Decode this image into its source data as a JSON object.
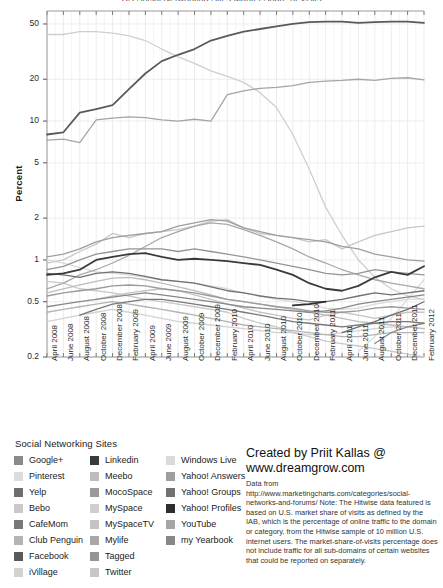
{
  "title_clipped": "US Social Networking Sites Market Share of Visits",
  "axes": {
    "ylabel": "Percent",
    "yticks": [
      "50",
      "20",
      "10",
      "5",
      "2",
      "1",
      "0.5",
      "0.2"
    ],
    "ytick_values": [
      50,
      20,
      10,
      5,
      2,
      1,
      0.5,
      0.2
    ],
    "yscale": "log",
    "ylim": [
      0.2,
      62
    ],
    "xticks": [
      "April 2008",
      "June 2008",
      "August 2008",
      "October 2008",
      "December 2008",
      "February 2009",
      "April 2009",
      "June 2009",
      "August 2009",
      "October 2009",
      "December 2009",
      "February 2010",
      "April 2010",
      "June 2010",
      "August 2010",
      "October 2010",
      "December 2010",
      "February 2011",
      "April 2011",
      "June 2011",
      "August 2011",
      "October 2011",
      "December 2011",
      "February 2012"
    ]
  },
  "legend": {
    "title": "Social Networking Sites",
    "columns": [
      [
        {
          "label": "Google+",
          "color": "#8a8a8a"
        },
        {
          "label": "Pinterest",
          "color": "#dcdcdc"
        },
        {
          "label": "Yelp",
          "color": "#6e6e6e"
        },
        {
          "label": "Bebo",
          "color": "#c9c9c9"
        },
        {
          "label": "CafeMom",
          "color": "#787878"
        },
        {
          "label": "Club Penguin",
          "color": "#b4b4b4"
        },
        {
          "label": "Facebook",
          "color": "#5a5a5a"
        },
        {
          "label": "iVillage",
          "color": "#d2d2d2"
        }
      ],
      [
        {
          "label": "Linkedin",
          "color": "#3a3a3a"
        },
        {
          "label": "Meebo",
          "color": "#bdbdbd"
        },
        {
          "label": "MocoSpace",
          "color": "#9a9a9a"
        },
        {
          "label": "MySpace",
          "color": "#cfcfcf"
        },
        {
          "label": "MySpaceTV",
          "color": "#c4c4c4"
        },
        {
          "label": "Mylife",
          "color": "#a8a8a8"
        },
        {
          "label": "Tagged",
          "color": "#949494"
        },
        {
          "label": "Twitter",
          "color": "#c7c7c7"
        }
      ],
      [
        {
          "label": "Windows Live",
          "color": "#dadada"
        },
        {
          "label": "Yahoo! Answers",
          "color": "#9e9e9e"
        },
        {
          "label": "Yahoo! Groups",
          "color": "#707070"
        },
        {
          "label": "Yahoo! Profiles",
          "color": "#2e2e2e"
        },
        {
          "label": "YouTube",
          "color": "#a5a5a5"
        },
        {
          "label": "my Yearbook",
          "color": "#888888"
        }
      ]
    ]
  },
  "credit": {
    "line1": "Created by Priit Kallas @",
    "line2": "www.dreamgrow.com",
    "note": "Data from http://www.marketingcharts.com/categories/social-networks-and-forums/ Note: The Hitwise data featured is based on U.S. market share of visits as defined by the IAB, which is the percentage of online traffic to the domain or category, from the Hitwise sample of 10 million U.S. internet users. The market-share-of-visits percentage does not include traffic for all sub-domains of certain websites that could be reported on separately."
  },
  "chart_data": {
    "type": "line",
    "title": "US Social Networking Sites Market Share of Visits",
    "xlabel": "",
    "ylabel": "Percent",
    "yscale": "log",
    "ylim": [
      0.2,
      62
    ],
    "grid": true,
    "legend_position": "below",
    "x": [
      "April 2008",
      "June 2008",
      "August 2008",
      "October 2008",
      "December 2008",
      "February 2009",
      "April 2009",
      "June 2009",
      "August 2009",
      "October 2009",
      "December 2009",
      "February 2010",
      "April 2010",
      "June 2010",
      "August 2010",
      "October 2010",
      "December 2010",
      "February 2011",
      "April 2011",
      "June 2011",
      "August 2011",
      "October 2011",
      "December 2011",
      "February 2012"
    ],
    "series": [
      {
        "name": "Facebook",
        "color": "#5a5a5a",
        "values": [
          8.0,
          8.3,
          11.5,
          12.2,
          13.0,
          17.0,
          22.0,
          27.0,
          30.0,
          33.0,
          38.0,
          41.0,
          44.0,
          46.0,
          48.0,
          50.0,
          51.5,
          52.0,
          52.0,
          51.0,
          51.5,
          52.0,
          52.0,
          51.0
        ]
      },
      {
        "name": "MySpace",
        "color": "#cfcfcf",
        "values": [
          42.0,
          42.0,
          44.0,
          44.0,
          43.0,
          41.0,
          38.0,
          33.0,
          29.0,
          26.0,
          23.0,
          21.0,
          19.0,
          16.0,
          12.5,
          8.0,
          4.5,
          2.4,
          1.5,
          1.0,
          0.75,
          0.62,
          0.55,
          0.52
        ]
      },
      {
        "name": "YouTube",
        "color": "#a5a5a5",
        "values": [
          7.3,
          7.4,
          7.0,
          10.2,
          10.5,
          10.7,
          10.6,
          10.2,
          10.0,
          10.3,
          10.0,
          15.5,
          16.5,
          17.2,
          17.5,
          18.0,
          19.0,
          19.4,
          19.6,
          20.0,
          19.6,
          20.3,
          20.5,
          19.8
        ]
      },
      {
        "name": "Twitter",
        "color": "#c7c7c7",
        "values": [
          0.95,
          1.0,
          1.15,
          1.3,
          1.55,
          1.45,
          1.55,
          1.6,
          1.65,
          1.75,
          1.9,
          1.95,
          1.7,
          1.55,
          1.5,
          1.45,
          1.35,
          1.4,
          1.2,
          1.35,
          1.5,
          1.6,
          1.7,
          1.75
        ]
      },
      {
        "name": "Yahoo! Answers",
        "color": "#9e9e9e",
        "values": [
          1.05,
          1.1,
          1.2,
          1.35,
          1.45,
          1.5,
          1.55,
          1.6,
          1.75,
          1.85,
          1.95,
          1.9,
          1.7,
          1.6,
          1.5,
          1.45,
          1.4,
          1.35,
          1.25,
          1.2,
          1.1,
          1.05,
          1.0,
          0.98
        ]
      },
      {
        "name": "Tagged",
        "color": "#949494",
        "values": [
          0.85,
          0.9,
          1.0,
          1.1,
          1.15,
          1.2,
          1.2,
          1.2,
          1.15,
          1.2,
          1.15,
          1.1,
          1.05,
          1.0,
          0.95,
          0.9,
          0.85,
          0.8,
          0.78,
          0.8,
          0.85,
          0.82,
          0.8,
          0.78
        ]
      },
      {
        "name": "Linkedin",
        "color": "#3a3a3a",
        "values": [
          0.78,
          0.8,
          0.85,
          1.0,
          1.05,
          1.1,
          1.12,
          1.05,
          1.0,
          1.02,
          1.0,
          0.98,
          0.95,
          0.92,
          0.85,
          0.78,
          0.68,
          0.62,
          0.6,
          0.65,
          0.75,
          0.82,
          0.78,
          0.9
        ]
      },
      {
        "name": "Yahoo! Groups",
        "color": "#707070",
        "values": [
          0.8,
          0.78,
          0.75,
          0.8,
          0.82,
          0.8,
          0.76,
          0.72,
          0.7,
          0.68,
          0.64,
          0.6,
          0.58,
          0.55,
          0.53,
          0.52,
          0.5,
          0.5,
          0.52,
          0.55,
          0.58,
          0.56,
          0.58,
          0.6
        ]
      },
      {
        "name": "Windows Live",
        "color": "#dadada",
        "values": [
          1.0,
          0.95,
          0.88,
          0.82,
          0.8,
          0.78,
          0.75,
          0.72,
          0.7,
          0.68,
          0.65,
          0.62,
          0.58,
          0.55,
          0.52,
          0.5,
          0.48,
          0.45,
          0.44,
          0.45,
          0.48,
          0.5,
          0.52,
          0.52
        ]
      },
      {
        "name": "Mylife",
        "color": "#a8a8a8",
        "values": [
          0.62,
          0.68,
          0.78,
          0.85,
          0.95,
          1.08,
          1.25,
          1.45,
          1.6,
          1.75,
          1.85,
          1.8,
          1.65,
          1.5,
          1.35,
          1.2,
          1.05,
          0.95,
          0.85,
          0.78,
          0.72,
          0.68,
          0.65,
          0.62
        ]
      },
      {
        "name": "Bebo",
        "color": "#c9c9c9",
        "values": [
          0.7,
          0.68,
          0.62,
          0.6,
          0.58,
          0.55,
          0.52,
          0.5,
          0.48,
          0.46,
          0.44,
          0.42,
          0.38,
          0.35,
          0.33,
          0.3,
          0.28,
          0.26,
          0.25,
          0.24,
          0.23,
          0.22,
          0.21,
          0.2
        ]
      },
      {
        "name": "MocoSpace",
        "color": "#9a9a9a",
        "values": [
          0.55,
          0.58,
          0.6,
          0.62,
          0.65,
          0.66,
          0.65,
          0.62,
          0.6,
          0.58,
          0.55,
          0.52,
          0.5,
          0.48,
          0.46,
          0.45,
          0.43,
          0.42,
          0.42,
          0.43,
          0.45,
          0.46,
          0.45,
          0.44
        ]
      },
      {
        "name": "Meebo",
        "color": "#bdbdbd",
        "values": [
          0.58,
          0.62,
          0.66,
          0.7,
          0.74,
          0.75,
          0.72,
          0.68,
          0.64,
          0.6,
          0.56,
          0.52,
          0.5,
          0.48,
          0.46,
          0.44,
          0.42,
          0.4,
          0.38,
          0.36,
          0.35,
          0.34,
          0.33,
          0.32
        ]
      },
      {
        "name": "Yahoo! Profiles",
        "color": "#2e2e2e",
        "values": [
          null,
          null,
          null,
          null,
          null,
          null,
          null,
          null,
          null,
          null,
          null,
          null,
          null,
          null,
          null,
          0.47,
          0.48,
          0.5,
          null,
          null,
          null,
          null,
          null,
          null
        ]
      },
      {
        "name": "MySpaceTV",
        "color": "#c4c4c4",
        "values": [
          null,
          null,
          null,
          0.52,
          0.55,
          0.58,
          0.6,
          0.62,
          0.6,
          0.56,
          0.52,
          0.48,
          0.45,
          0.42,
          0.4,
          0.38,
          0.37,
          0.4,
          0.42,
          0.4,
          0.38,
          0.4,
          0.42,
          0.42
        ]
      },
      {
        "name": "CafeMom",
        "color": "#787878",
        "values": [
          null,
          null,
          0.4,
          0.44,
          0.48,
          0.5,
          0.52,
          0.52,
          0.5,
          0.48,
          0.46,
          0.44,
          0.42,
          0.4,
          0.38,
          0.36,
          0.35,
          0.34,
          0.33,
          0.34,
          0.35,
          0.36,
          0.36,
          0.35
        ]
      },
      {
        "name": "Club Penguin",
        "color": "#b4b4b4",
        "values": [
          0.42,
          0.44,
          0.46,
          0.48,
          0.5,
          0.48,
          0.46,
          0.44,
          0.42,
          0.4,
          0.38,
          0.36,
          0.34,
          0.33,
          0.32,
          0.31,
          0.3,
          0.29,
          0.28,
          0.28,
          0.29,
          0.3,
          0.3,
          0.3
        ]
      },
      {
        "name": "iVillage",
        "color": "#d2d2d2",
        "values": [
          0.36,
          0.38,
          0.4,
          0.42,
          0.44,
          0.42,
          0.4,
          0.38,
          0.36,
          0.35,
          0.34,
          0.33,
          0.32,
          0.31,
          0.3,
          0.3,
          0.29,
          0.29,
          0.3,
          0.31,
          0.32,
          0.33,
          0.33,
          0.32
        ]
      },
      {
        "name": "my Yearbook",
        "color": "#888888",
        "values": [
          0.46,
          0.48,
          0.5,
          0.52,
          0.54,
          0.56,
          0.58,
          0.56,
          0.54,
          0.52,
          0.5,
          0.48,
          0.46,
          0.45,
          0.44,
          0.43,
          0.42,
          0.43,
          0.45,
          0.48,
          0.5,
          0.52,
          0.54,
          0.56
        ]
      },
      {
        "name": "Yelp",
        "color": "#6e6e6e",
        "values": [
          null,
          null,
          null,
          null,
          null,
          null,
          null,
          null,
          null,
          null,
          null,
          null,
          null,
          null,
          null,
          null,
          null,
          null,
          0.3,
          0.33,
          0.36,
          0.4,
          0.44,
          0.5
        ]
      },
      {
        "name": "Google+",
        "color": "#8a8a8a",
        "values": [
          null,
          null,
          null,
          null,
          null,
          null,
          null,
          null,
          null,
          null,
          null,
          null,
          null,
          null,
          null,
          null,
          null,
          null,
          null,
          null,
          0.25,
          0.3,
          0.33,
          0.35
        ]
      },
      {
        "name": "Pinterest",
        "color": "#dcdcdc",
        "values": [
          null,
          null,
          null,
          null,
          null,
          null,
          null,
          null,
          null,
          null,
          null,
          null,
          null,
          null,
          null,
          null,
          null,
          null,
          null,
          0.22,
          0.28,
          0.38,
          0.52,
          0.72
        ]
      }
    ]
  }
}
